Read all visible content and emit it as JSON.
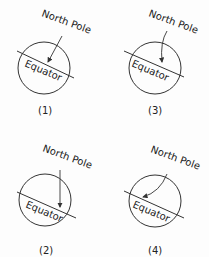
{
  "diagrams": [
    {
      "id": "1",
      "caption": "(1)",
      "pole_label": "North Pole",
      "equator_label": "Equator",
      "arrow": "straight-diagonal"
    },
    {
      "id": "3",
      "caption": "(3)",
      "pole_label": "North Pole",
      "equator_label": "Equator",
      "arrow": "curved-down-left"
    },
    {
      "id": "2",
      "caption": "(2)",
      "pole_label": "North Pole",
      "equator_label": "Equator",
      "arrow": "straight-vertical"
    },
    {
      "id": "4",
      "caption": "(4)",
      "pole_label": "North Pole",
      "equator_label": "Equator",
      "arrow": "curved-strong-left"
    }
  ],
  "colors": {
    "line": "#333333",
    "background": "#fdfdfd"
  }
}
